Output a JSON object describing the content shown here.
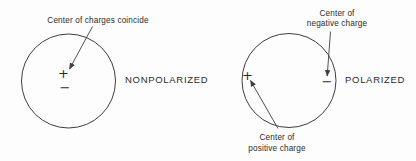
{
  "canvas": {
    "background": "#fdfdfd",
    "line_color": "#3e3e3e",
    "text_color": "#2b2b2b"
  },
  "nonpolarized": {
    "annotation": "Center of charges coincide",
    "plus_symbol": "+",
    "minus_symbol": "−",
    "label": "NONPOLARIZED"
  },
  "polarized": {
    "negative_annotation_line1": "Center of",
    "negative_annotation_line2": "negative charge",
    "positive_annotation_line1": "Center of",
    "positive_annotation_line2": "positive charge",
    "plus_symbol": "+",
    "minus_symbol": "−",
    "label": "POLARIZED"
  }
}
